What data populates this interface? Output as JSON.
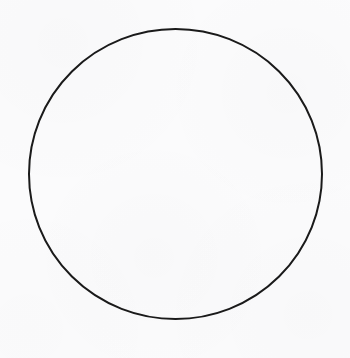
{
  "canvas": {
    "width": 350,
    "height": 358,
    "background_color": "#fbfbfc",
    "description": "Blank off-white page containing a single empty circle outline"
  },
  "figure": {
    "name": "circle-outline",
    "shape_type": "circle",
    "fill": "none",
    "stroke_color": "#1a1a1a",
    "stroke_width": 2,
    "center_x": 175.5,
    "center_y": 174,
    "radius_x": 146.5,
    "radius_y": 145,
    "bounds": {
      "left": 29,
      "top": 29,
      "right": 322,
      "bottom": 319
    }
  },
  "text": {
    "labels": [],
    "annotations": []
  }
}
